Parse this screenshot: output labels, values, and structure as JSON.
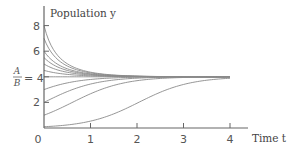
{
  "chart_data": {
    "type": "line",
    "title": "",
    "xlabel": "Time t",
    "ylabel": "Population y",
    "xlim": [
      0,
      4
    ],
    "ylim": [
      0,
      8
    ],
    "x_ticks": [
      "0",
      "1",
      "2",
      "3",
      "4"
    ],
    "y_ticks": [
      "2",
      "4",
      "6",
      "8"
    ],
    "equilibrium_label": {
      "numerator": "A",
      "denominator": "B",
      "equals": "= 4"
    },
    "grid": false,
    "legend": null,
    "model": "logistic: y(t) = 4 / (1 + ((4 - y0)/y0) e^(-1.8 t))",
    "series": [
      {
        "name": "y0=8",
        "y0": 8
      },
      {
        "name": "y0=7",
        "y0": 7
      },
      {
        "name": "y0=6",
        "y0": 6
      },
      {
        "name": "y0=5.5",
        "y0": 5.5
      },
      {
        "name": "y0=5",
        "y0": 5
      },
      {
        "name": "y0=4.5",
        "y0": 4.5
      },
      {
        "name": "y0=4 (equilibrium)",
        "y0": 4
      },
      {
        "name": "y0=3",
        "y0": 3
      },
      {
        "name": "y0=2",
        "y0": 2
      },
      {
        "name": "y0=1",
        "y0": 1
      },
      {
        "name": "y0=0.1",
        "y0": 0.1
      }
    ],
    "growth_rate": 1.8,
    "carrying_capacity": 4
  },
  "colors": {
    "axis": "#555555",
    "curve": "#8a8a8a",
    "text": "#555555"
  }
}
